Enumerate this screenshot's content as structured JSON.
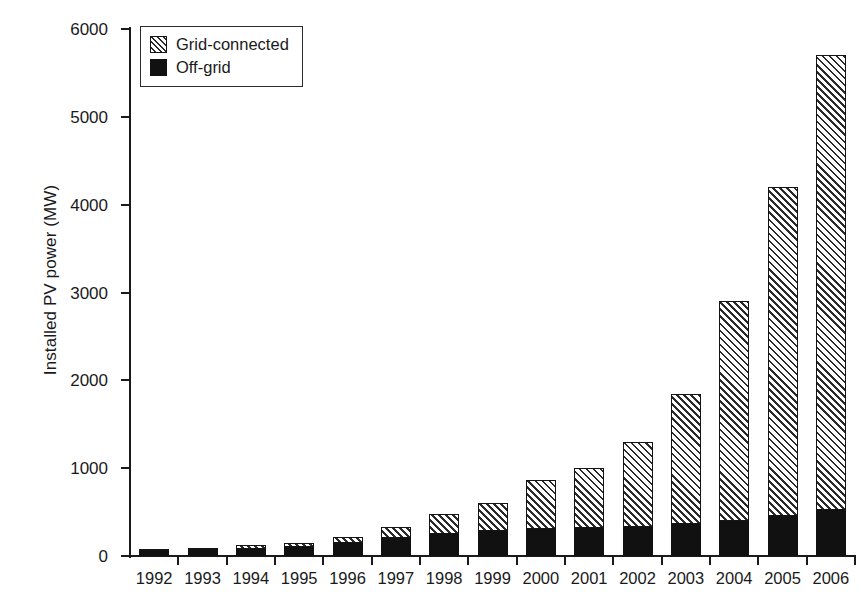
{
  "chart_data": {
    "type": "bar",
    "stacked": true,
    "title": "",
    "xlabel": "",
    "ylabel": "Installed PV power (MW)",
    "categories": [
      "1992",
      "1993",
      "1994",
      "1995",
      "1996",
      "1997",
      "1998",
      "1999",
      "2000",
      "2001",
      "2002",
      "2003",
      "2004",
      "2005",
      "2006"
    ],
    "series": [
      {
        "name": "Off-grid",
        "style": "solid-black",
        "color": "#111111",
        "values": [
          60,
          70,
          85,
          105,
          150,
          200,
          250,
          280,
          305,
          315,
          330,
          360,
          400,
          450,
          520
        ]
      },
      {
        "name": "Grid-connected",
        "style": "diagonal-hatch",
        "color": "#ffffff",
        "values": [
          20,
          25,
          35,
          40,
          65,
          125,
          230,
          320,
          560,
          685,
          970,
          1490,
          2500,
          3750,
          5180
        ]
      }
    ],
    "totals": [
      80,
      95,
      120,
      145,
      215,
      325,
      480,
      600,
      865,
      1000,
      1300,
      1850,
      2900,
      4200,
      5700
    ],
    "ylim": [
      0,
      6000
    ],
    "yticks": [
      0,
      1000,
      2000,
      3000,
      4000,
      5000,
      6000
    ],
    "ytick_labels": [
      "0",
      "1000",
      "2000",
      "3000",
      "4000",
      "5000",
      "6000"
    ],
    "grid": false,
    "legend_position": "upper-left",
    "legend_entries": [
      "Grid-connected",
      "Off-grid"
    ]
  },
  "legend": {
    "items": [
      {
        "label": "Grid-connected",
        "swatch": "hatch-swatch"
      },
      {
        "label": "Off-grid",
        "swatch": "solid-swatch"
      }
    ]
  },
  "axes": {
    "y_title": "Installed PV power (MW)"
  }
}
